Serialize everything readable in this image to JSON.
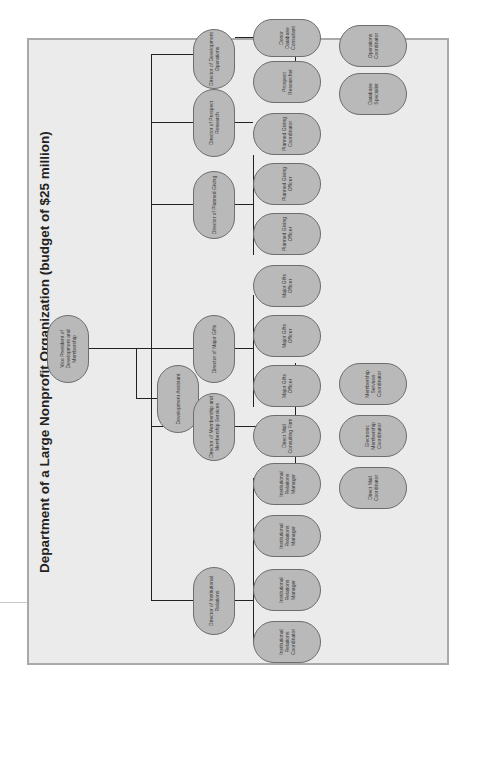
{
  "title": "Department of a Large Nonprofit Organization (budget of $25 million)",
  "chart": {
    "root": "Vice President of Development and Membership",
    "assistant": "Development Assistant",
    "directors": [
      {
        "name": "Director of Institutional Relations",
        "reports": [
          "Institutional Relations Coordinator",
          "Institutional Relations Manager",
          "Institutional Relations Manager",
          "Institutional Relations Manager"
        ]
      },
      {
        "name": "Director of Membership and Membership Services",
        "reports": [
          "Direct Mail Consulting Firm",
          "Direct Mail Coordinator",
          "Electronic Membership Coordinator",
          "Membership Services Coordinator"
        ]
      },
      {
        "name": "Director of Major Gifts",
        "reports": [
          "Major Gifts Officer",
          "Major Gifts Officer",
          "Major Gifts Officer"
        ]
      },
      {
        "name": "Director of Planned Giving",
        "reports": [
          "Planned Giving Officer",
          "Planned Giving Officer",
          "Planned Giving Coordinator"
        ]
      },
      {
        "name": "Director of Prospect Research",
        "reports": [
          "Prospect Researcher"
        ]
      },
      {
        "name": "Director of Development Operations",
        "reports": [
          "Donor Database Consultant",
          "Database Specialist",
          "Operations Coordinator"
        ]
      }
    ]
  },
  "colors": {
    "node_fill": "#b9b9b9",
    "node_border": "#6d6d6d",
    "background": "#ebebeb",
    "frame": "#a9a9a9",
    "line": "#222222"
  }
}
